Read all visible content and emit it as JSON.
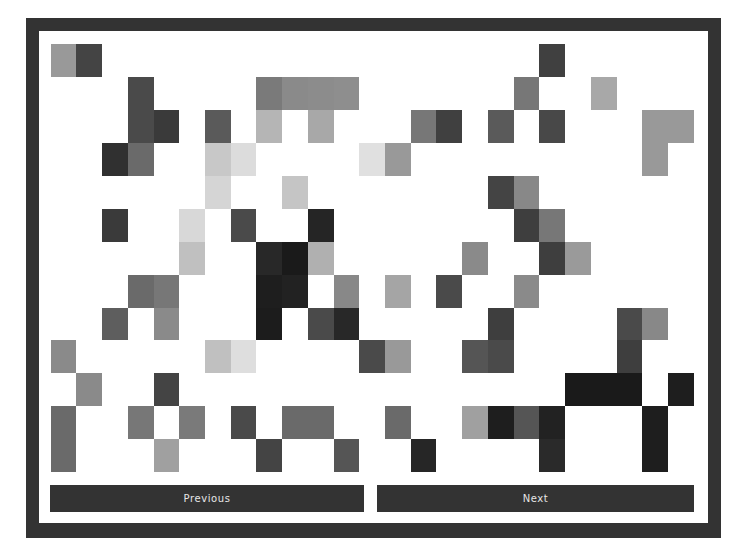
{
  "app": {
    "type": "pixel-grid-pattern-viewer"
  },
  "frame": {
    "border_color": "#333333",
    "background": "#ffffff"
  },
  "grid": {
    "columns": 25,
    "rows_count": 13,
    "empty_color": "",
    "rows": [
      [
        "#999999",
        "#444444",
        "",
        "",
        "",
        "",
        "",
        "",
        "",
        "",
        "",
        "",
        "",
        "",
        "",
        "",
        "",
        "",
        "",
        "#404040",
        "",
        "",
        "",
        "",
        ""
      ],
      [
        "",
        "",
        "",
        "#4a4a4a",
        "",
        "",
        "",
        "",
        "#7a7a7a",
        "#8a8a8a",
        "#8c8c8c",
        "#8e8e8e",
        "",
        "",
        "",
        "",
        "",
        "",
        "#777777",
        "",
        "",
        "#a8a8a8",
        "",
        "",
        ""
      ],
      [
        "",
        "",
        "",
        "#4a4a4a",
        "#3a3a3a",
        "",
        "#5a5a5a",
        "",
        "#b5b5b5",
        "",
        "#a8a8a8",
        "",
        "",
        "",
        "#777777",
        "#404040",
        "",
        "#5a5a5a",
        "",
        "#484848",
        "",
        "",
        "",
        "#999999",
        "#999999"
      ],
      [
        "",
        "",
        "#303030",
        "#6a6a6a",
        "",
        "",
        "#c8c8c8",
        "#dcdcdc",
        "",
        "",
        "",
        "",
        "#e0e0e0",
        "#999999",
        "",
        "",
        "",
        "",
        "",
        "",
        "",
        "",
        "",
        "#999999",
        ""
      ],
      [
        "",
        "",
        "",
        "",
        "",
        "",
        "#d5d5d5",
        "",
        "",
        "#c5c5c5",
        "",
        "",
        "",
        "",
        "",
        "",
        "",
        "#444444",
        "#888888",
        "",
        "",
        "",
        "",
        "",
        ""
      ],
      [
        "",
        "",
        "#3a3a3a",
        "",
        "",
        "#d8d8d8",
        "",
        "#4a4a4a",
        "",
        "",
        "#252525",
        "",
        "",
        "",
        "",
        "",
        "",
        "",
        "#3e3e3e",
        "#777777",
        "",
        "",
        "",
        "",
        ""
      ],
      [
        "",
        "",
        "",
        "",
        "",
        "#c0c0c0",
        "",
        "",
        "#282828",
        "#1a1a1a",
        "#b0b0b0",
        "",
        "",
        "",
        "",
        "",
        "#8a8a8a",
        "",
        "",
        "#3e3e3e",
        "#9a9a9a",
        "",
        "",
        "",
        ""
      ],
      [
        "",
        "",
        "",
        "#6a6a6a",
        "#777777",
        "",
        "",
        "",
        "#1e1e1e",
        "#222222",
        "",
        "#888888",
        "",
        "#a5a5a5",
        "",
        "#4a4a4a",
        "",
        "",
        "#8a8a8a",
        "",
        "",
        "",
        "",
        "",
        ""
      ],
      [
        "",
        "",
        "#5e5e5e",
        "",
        "#8a8a8a",
        "",
        "",
        "",
        "#1c1c1c",
        "",
        "#4a4a4a",
        "#282828",
        "",
        "",
        "",
        "",
        "",
        "#3e3e3e",
        "",
        "",
        "",
        "",
        "#4a4a4a",
        "#888888",
        ""
      ],
      [
        "#8a8a8a",
        "",
        "",
        "",
        "",
        "",
        "#c0c0c0",
        "#dedede",
        "",
        "",
        "",
        "",
        "#4a4a4a",
        "#999999",
        "",
        "",
        "#555555",
        "#4a4a4a",
        "",
        "",
        "",
        "",
        "#3e3e3e",
        "",
        ""
      ],
      [
        "",
        "#8a8a8a",
        "",
        "",
        "#444444",
        "",
        "",
        "",
        "",
        "",
        "",
        "",
        "",
        "",
        "",
        "",
        "",
        "",
        "",
        "",
        "#1a1a1a",
        "#1a1a1a",
        "#1a1a1a",
        "",
        "#1e1e1e"
      ],
      [
        "#6a6a6a",
        "",
        "",
        "#777777",
        "",
        "#7a7a7a",
        "",
        "#4a4a4a",
        "",
        "#6a6a6a",
        "#6a6a6a",
        "",
        "",
        "#6a6a6a",
        "",
        "",
        "#a0a0a0",
        "#1e1e1e",
        "#555555",
        "#222222",
        "",
        "",
        "",
        "#1e1e1e",
        ""
      ],
      [
        "#6a6a6a",
        "",
        "",
        "",
        "#a0a0a0",
        "",
        "",
        "",
        "#444444",
        "",
        "",
        "#555555",
        "",
        "",
        "#262626",
        "",
        "",
        "",
        "",
        "#2a2a2a",
        "",
        "",
        "",
        "#1e1e1e",
        ""
      ]
    ]
  },
  "buttons": {
    "previous": {
      "label": "Previous",
      "icon": "none"
    },
    "next": {
      "label": "Next",
      "icon": "none"
    }
  },
  "colors": {
    "button_bg": "#333333",
    "button_text": "#e6e6e6"
  }
}
